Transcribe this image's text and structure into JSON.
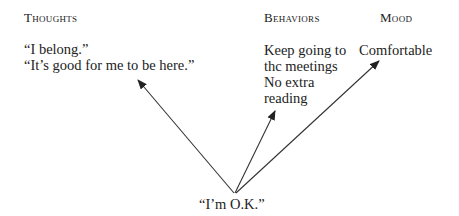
{
  "headings": {
    "thoughts": "Thoughts",
    "behaviors": "Behaviors",
    "mood": "Mood"
  },
  "thoughts": [
    "“I belong.”",
    "“It’s good for me to be here.”"
  ],
  "behaviors": [
    "Keep going to",
    "thc meetings",
    "No extra",
    "reading"
  ],
  "mood": [
    "Comfortable"
  ],
  "origin": "“I’m O.K.”",
  "arrows": [
    {
      "from": "origin",
      "to": "thoughts"
    },
    {
      "from": "origin",
      "to": "behaviors"
    },
    {
      "from": "origin",
      "to": "mood"
    }
  ]
}
